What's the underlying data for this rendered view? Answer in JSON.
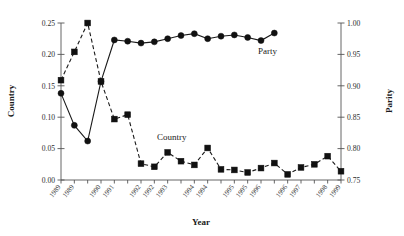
{
  "chart_data": {
    "type": "line",
    "title": "",
    "xlabel": "Year",
    "grid": false,
    "legend": "inline-annotation",
    "x_tick_labels": [
      "1989",
      "1989",
      "1990",
      "1991",
      "1992",
      "1992",
      "1993",
      "1994",
      "1994",
      "1995",
      "1995",
      "1996",
      "1996",
      "1997",
      "1998",
      "1999"
    ],
    "x_indices": [
      0,
      1,
      2,
      3,
      4,
      5,
      6,
      7,
      8,
      9,
      10,
      11,
      12,
      13,
      14,
      15,
      16,
      17,
      18,
      19,
      20,
      21
    ],
    "axes": [
      {
        "id": "left",
        "label": "Country",
        "ylim": [
          0.0,
          0.25
        ],
        "ticks": [
          0.0,
          0.05,
          0.1,
          0.15,
          0.2,
          0.25
        ],
        "tick_labels": [
          "0.00",
          "0.05",
          "0.10",
          "0.15",
          "0.20",
          "0.25"
        ]
      },
      {
        "id": "right",
        "label": "Parity",
        "ylim": [
          0.75,
          1.0
        ],
        "ticks": [
          0.75,
          0.8,
          0.85,
          0.9,
          0.95,
          1.0
        ],
        "tick_labels": [
          "0.75",
          "0.80",
          "0.85",
          "0.90",
          "0.95",
          "1.00"
        ]
      }
    ],
    "series": [
      {
        "name": "Country",
        "axis": "left",
        "marker": "square",
        "line": "dashed",
        "color": "#111111",
        "annotation": "Country",
        "values": [
          0.159,
          0.204,
          0.25,
          0.157,
          0.097,
          0.104,
          0.026,
          0.021,
          0.044,
          0.03,
          0.024,
          0.051,
          0.017,
          0.016,
          0.012,
          0.019,
          0.027,
          0.009,
          0.02,
          0.025,
          0.038,
          0.014
        ]
      },
      {
        "name": "Party",
        "axis": "right",
        "marker": "circle",
        "line": "solid",
        "color": "#111111",
        "annotation": "Party",
        "values": [
          0.888,
          0.837,
          0.812,
          0.907,
          0.973,
          0.971,
          0.968,
          0.97,
          0.975,
          0.98,
          0.983,
          0.975,
          0.979,
          0.981,
          0.977,
          0.972,
          0.984,
          null,
          null,
          null,
          null,
          null
        ]
      }
    ],
    "party_values_aligned": [
      0.888,
      0.837,
      0.812,
      0.907,
      0.973,
      0.971,
      0.968,
      0.97,
      0.975,
      0.98,
      0.983,
      0.975,
      0.979,
      0.981,
      0.977,
      0.972,
      0.984
    ]
  }
}
